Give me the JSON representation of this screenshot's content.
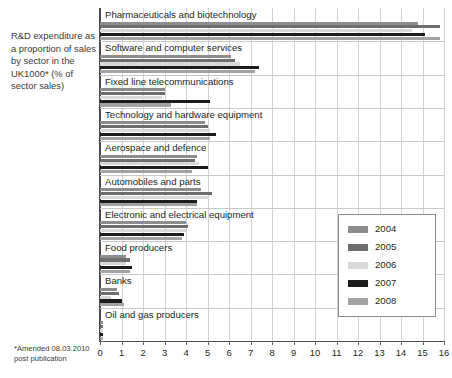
{
  "caption": {
    "text": "R&D expenditure as a proportion of sales by sector in the UK1000* (% of sector sales)"
  },
  "footnote": {
    "text": "*Amended 08.03.2010 post publication"
  },
  "chart_data": {
    "type": "bar",
    "orientation": "horizontal",
    "title": "R&D expenditure as a proportion of sales by sector in the UK1000* (% of sector sales)",
    "xlabel": "",
    "ylabel": "",
    "xlim": [
      0,
      16
    ],
    "xticks": [
      "0",
      "1",
      "2",
      "3",
      "4",
      "5",
      "6",
      "7",
      "8",
      "9",
      "10",
      "11",
      "12",
      "13",
      "14",
      "15",
      "16"
    ],
    "grid": "vertical",
    "legend_position": "center-right",
    "categories": [
      "Pharmaceuticals and biotechnology",
      "Software and computer services",
      "Fixed line telecommunications",
      "Technology and hardware equipment",
      "Aerospace and defence",
      "Automobiles and parts",
      "Electronic and electrical equipment",
      "Food producers",
      "Banks",
      "Oil and gas producers"
    ],
    "series": [
      {
        "name": "2004",
        "color": "#8d8d8d",
        "values": [
          14.8,
          6.1,
          3.0,
          4.9,
          4.5,
          4.7,
          4.0,
          1.2,
          0.8,
          0.15
        ]
      },
      {
        "name": "2005",
        "color": "#6e6e6e",
        "values": [
          15.8,
          6.3,
          3.0,
          5.0,
          4.4,
          5.2,
          4.1,
          1.4,
          0.9,
          0.15
        ]
      },
      {
        "name": "2006",
        "color": "#d8d8d8",
        "values": [
          14.5,
          6.5,
          2.9,
          5.1,
          4.6,
          5.0,
          4.0,
          1.2,
          0.5,
          0.13
        ]
      },
      {
        "name": "2007",
        "color": "#1c1c1c",
        "values": [
          15.1,
          7.4,
          5.1,
          5.4,
          5.0,
          4.5,
          3.9,
          1.5,
          1.0,
          0.14
        ]
      },
      {
        "name": "2008",
        "color": "#a3a3a3",
        "values": [
          15.8,
          7.2,
          3.3,
          5.1,
          4.3,
          4.5,
          3.8,
          1.4,
          1.1,
          0.12
        ]
      }
    ]
  },
  "legend": {
    "items": [
      {
        "label": "2004"
      },
      {
        "label": "2005"
      },
      {
        "label": "2006"
      },
      {
        "label": "2007"
      },
      {
        "label": "2008"
      }
    ]
  }
}
